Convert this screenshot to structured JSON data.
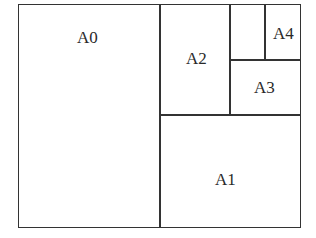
{
  "diagram": {
    "title": "",
    "sheets": [
      {
        "id": "A0",
        "label": "A0"
      },
      {
        "id": "A1",
        "label": "A1"
      },
      {
        "id": "A2",
        "label": "A2"
      },
      {
        "id": "A3",
        "label": "A3"
      },
      {
        "id": "A4",
        "label": "A4"
      }
    ],
    "colors": {
      "line": "#333333",
      "text": "#2a2a2a",
      "background": "#ffffff"
    }
  }
}
